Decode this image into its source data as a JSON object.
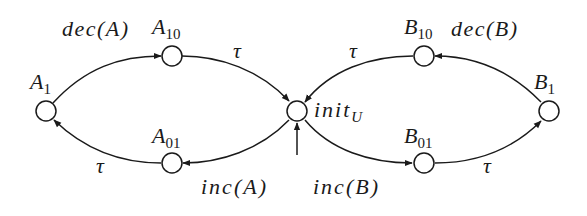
{
  "diagram": {
    "type": "state-machine",
    "colors": {
      "stroke": "#1a1a1a",
      "background": "#ffffff"
    },
    "nodes": [
      {
        "id": "A1",
        "label": "A",
        "sub": "1",
        "x": 46,
        "y": 111
      },
      {
        "id": "A10",
        "label": "A",
        "sub": "10",
        "x": 172,
        "y": 56
      },
      {
        "id": "A01",
        "label": "A",
        "sub": "01",
        "x": 172,
        "y": 163
      },
      {
        "id": "initU",
        "label": "init",
        "sub": "U",
        "x": 297,
        "y": 111,
        "initial": true
      },
      {
        "id": "B10",
        "label": "B",
        "sub": "10",
        "x": 424,
        "y": 56
      },
      {
        "id": "B01",
        "label": "B",
        "sub": "01",
        "x": 424,
        "y": 163
      },
      {
        "id": "B1",
        "label": "B",
        "sub": "1",
        "x": 549,
        "y": 111
      }
    ],
    "edges": [
      {
        "from": "A1",
        "to": "A10",
        "label": "dec(A)"
      },
      {
        "from": "A10",
        "to": "initU",
        "label": "τ"
      },
      {
        "from": "initU",
        "to": "A01",
        "label": "inc(A)"
      },
      {
        "from": "A01",
        "to": "A1",
        "label": "τ"
      },
      {
        "from": "B1",
        "to": "B10",
        "label": "dec(B)"
      },
      {
        "from": "B10",
        "to": "initU",
        "label": "τ"
      },
      {
        "from": "initU",
        "to": "B01",
        "label": "inc(B)"
      },
      {
        "from": "B01",
        "to": "B1",
        "label": "τ"
      }
    ]
  },
  "labels": {
    "A1": "A",
    "A1_sub": "1",
    "A10": "A",
    "A10_sub": "10",
    "A01": "A",
    "A01_sub": "01",
    "initU": "init",
    "initU_sub": "U",
    "B10": "B",
    "B10_sub": "10",
    "B01": "B",
    "B01_sub": "01",
    "B1": "B",
    "B1_sub": "1",
    "decA": "dec(A)",
    "tauA10": "τ",
    "incA": "inc(A)",
    "tauA01": "τ",
    "decB": "dec(B)",
    "tauB10": "τ",
    "incB": "inc(B)",
    "tauB01": "τ"
  }
}
